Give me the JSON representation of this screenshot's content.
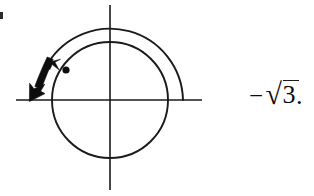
{
  "figure": {
    "background_color": "#ffffff",
    "ink_color": "#1a1a1a",
    "width": 314,
    "height": 196
  },
  "axes": {
    "origin": {
      "x": 110,
      "y": 100
    },
    "horizontal": {
      "x1": 16,
      "y1": 100,
      "x2": 202,
      "y2": 100
    },
    "vertical": {
      "x1": 110,
      "y1": 5,
      "x2": 110,
      "y2": 190
    },
    "stroke_width": 1.6,
    "color": "#1a1a1a"
  },
  "circle": {
    "name": "unit-circle",
    "cx": 110,
    "cy": 100,
    "r": 58,
    "stroke_width": 1.9,
    "color": "#1a1a1a",
    "fill": "none"
  },
  "arc": {
    "name": "rotation-arc",
    "cx": 110,
    "cy": 100,
    "r": 73,
    "start_angle_deg": 0,
    "end_angle_deg": 150,
    "direction": "counterclockwise",
    "stroke_width": 1.9,
    "color": "#1a1a1a",
    "arrowhead": "at-end"
  },
  "terminal_point": {
    "name": "terminal-point-marker",
    "cx": 66,
    "cy": 70,
    "r": 3.6,
    "angle_deg": 150,
    "color": "#0d0d0d"
  },
  "bold_arrow": {
    "name": "direction-arrow",
    "description": "thick tapered arrow pointing down-left toward the negative x-axis",
    "tail_x": 48,
    "tail_y": 58,
    "tip_x": 29,
    "tip_y": 100,
    "color": "#0d0d0d"
  },
  "expression": {
    "name": "negative-square-root-of-three",
    "minus": "−",
    "radical": "√",
    "radicand": "3",
    "period": ".",
    "full_text": "−√3.",
    "color": "#0d0d0d"
  },
  "artifact": {
    "name": "scan-edge-mark",
    "x": 0,
    "y": 12
  }
}
